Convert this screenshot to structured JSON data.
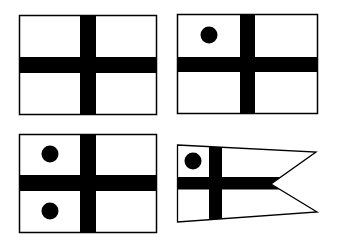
{
  "figure": {
    "colors": {
      "background": "#ffffff",
      "ink": "#000000"
    },
    "flags": [
      {
        "name": "plain-cross-flag",
        "shape": "rectangle",
        "dots": 0
      },
      {
        "name": "cross-flag-one-dot",
        "shape": "rectangle",
        "dots": 1
      },
      {
        "name": "cross-flag-two-dots",
        "shape": "rectangle",
        "dots": 2
      },
      {
        "name": "cross-pennant-one-dot",
        "shape": "swallowtail-pennant",
        "dots": 1
      }
    ]
  }
}
